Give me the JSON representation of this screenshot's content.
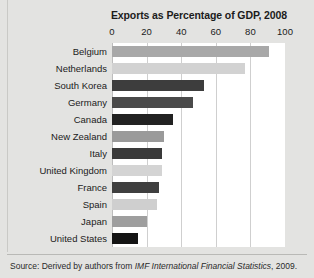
{
  "chart_data": {
    "type": "bar",
    "orientation": "horizontal",
    "title": "Exports as Percentage of GDP, 2008",
    "xlabel": "",
    "ylabel": "",
    "xlim": [
      0,
      100
    ],
    "xticks": [
      0,
      20,
      40,
      60,
      80,
      100
    ],
    "xtick_labels": [
      "0",
      "20",
      "40",
      "60",
      "80",
      "100"
    ],
    "grid": true,
    "legend": "none",
    "categories": [
      "Belgium",
      "Netherlands",
      "South Korea",
      "Germany",
      "Canada",
      "New Zealand",
      "Italy",
      "United Kingdom",
      "France",
      "Spain",
      "Japan",
      "United States"
    ],
    "values": [
      91,
      77,
      53,
      47,
      35,
      30,
      29,
      29,
      27,
      26,
      20,
      15
    ],
    "bar_colors": [
      "#a8a8a8",
      "#d2d2d2",
      "#3d3d3d",
      "#4a4a4a",
      "#222222",
      "#9a9a9a",
      "#3a3a3a",
      "#d4d4d4",
      "#3f3f3f",
      "#cfcfcf",
      "#9e9e9e",
      "#141414"
    ]
  },
  "source": {
    "label": "Source:",
    "text_before": " Derived by authors from ",
    "italic_text": "IMF International Financial Statistics",
    "text_after": ", 2009."
  },
  "colors": {
    "page_background": "#e3e3e1",
    "plot_background": "#ffffff",
    "gridline": "#cfcfcf",
    "text": "#1b1b1b",
    "rule": "#b9b9b6"
  }
}
